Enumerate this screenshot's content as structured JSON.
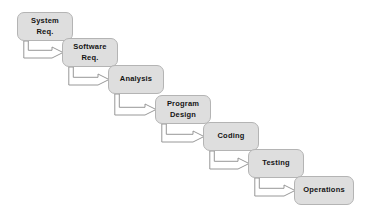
{
  "diagram": {
    "type": "waterfall-model-flowchart",
    "background_color": "#ffffff",
    "box_fill_color": "#dedede",
    "box_border_color": "#b4b4b4",
    "text_color": "#141414",
    "connector_color": "#8c8c8c",
    "connector_fill": "#ffffff",
    "stages": [
      {
        "id": "system-req",
        "label": "System\nReq.",
        "x": 17,
        "y": 12,
        "width": 56,
        "height": 29
      },
      {
        "id": "software-req",
        "label": "Software\nReq.",
        "x": 62,
        "y": 38,
        "width": 56,
        "height": 29
      },
      {
        "id": "analysis",
        "label": "Analysis",
        "x": 108,
        "y": 65,
        "width": 56,
        "height": 29
      },
      {
        "id": "program-design",
        "label": "Program\nDesign",
        "x": 155,
        "y": 95,
        "width": 56,
        "height": 29
      },
      {
        "id": "coding",
        "label": "Coding",
        "x": 203,
        "y": 122,
        "width": 56,
        "height": 29
      },
      {
        "id": "testing",
        "label": "Testing",
        "x": 248,
        "y": 149,
        "width": 56,
        "height": 29
      },
      {
        "id": "operations",
        "label": "Operations",
        "x": 294,
        "y": 176,
        "width": 60,
        "height": 29
      }
    ],
    "connectors": [
      {
        "id": "system-req-to-software-req",
        "from": "system-req",
        "to": "software-req"
      },
      {
        "id": "software-req-to-analysis",
        "from": "software-req",
        "to": "analysis"
      },
      {
        "id": "analysis-to-program-design",
        "from": "analysis",
        "to": "program-design"
      },
      {
        "id": "program-design-to-coding",
        "from": "program-design",
        "to": "coding"
      },
      {
        "id": "coding-to-testing",
        "from": "coding",
        "to": "testing"
      },
      {
        "id": "testing-to-operations",
        "from": "testing",
        "to": "operations"
      }
    ]
  }
}
